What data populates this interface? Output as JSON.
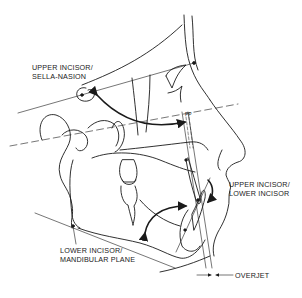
{
  "diagram": {
    "type": "cephalometric tracing (lateral skull profile)",
    "background": "#ffffff",
    "ink": "#1a1a1a",
    "labels": {
      "upper_incisor_sn": {
        "line1": "UPPER INCISOR/",
        "line2": "SELLA-NASION"
      },
      "upper_lower_incisor": {
        "line1": "UPPER INCISOR/",
        "line2": "LOWER INCISOR"
      },
      "lower_incisor_mp": {
        "line1": "LOWER INCISOR/",
        "line2": "MANDIBULAR PLANE"
      },
      "overjet": "OVERJET",
      "palatal_plane": "PP"
    }
  }
}
